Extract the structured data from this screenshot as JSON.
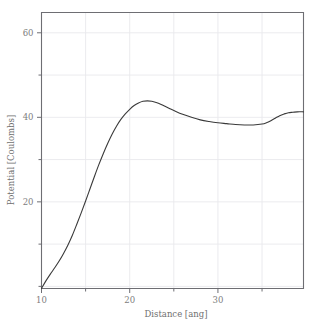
{
  "chart_data": {
    "type": "line",
    "title": "",
    "subtitle": "",
    "xlabel": "Distance [ang]",
    "ylabel": "Potential [Coulombs]",
    "xlim": [
      10,
      39.7
    ],
    "ylim": [
      -0.5,
      64.8
    ],
    "xticks": [
      10,
      15,
      20,
      25,
      30,
      35
    ],
    "xticklabels": [
      "10",
      "",
      "20",
      "",
      "30",
      ""
    ],
    "xtick_major_labeled": [
      "10",
      "20",
      "30"
    ],
    "yticks": [
      0,
      10,
      20,
      30,
      40,
      50,
      60
    ],
    "yticklabels": [
      "",
      "",
      "20",
      "",
      "40",
      "",
      "60"
    ],
    "ytick_major_labeled": [
      "20",
      "40",
      "60"
    ],
    "grid": true,
    "grid_color": "#e9e9ec",
    "legend": null,
    "legend_position": "none",
    "line_color": "#3a3a3a",
    "line_width": 1.1,
    "axis_color": "#6e6e73",
    "background": "#ffffff",
    "series": [
      {
        "name": "potential",
        "x": [
          10.0,
          10.5,
          11.0,
          11.5,
          12.0,
          12.5,
          13.0,
          13.5,
          14.0,
          14.5,
          15.0,
          15.5,
          16.0,
          16.5,
          17.0,
          17.5,
          18.0,
          18.5,
          19.0,
          19.5,
          20.0,
          20.5,
          21.0,
          21.5,
          22.0,
          22.5,
          23.0,
          23.5,
          24.0,
          24.5,
          25.0,
          26.0,
          27.0,
          28.0,
          29.0,
          30.0,
          31.0,
          32.0,
          33.0,
          34.0,
          35.0,
          35.5,
          36.0,
          36.5,
          37.0,
          37.5,
          38.0,
          38.5,
          39.0,
          39.7
        ],
        "y": [
          -0.5,
          1.3,
          2.9,
          4.4,
          6.0,
          7.8,
          9.8,
          12.1,
          14.7,
          17.4,
          20.2,
          23.1,
          26.0,
          28.8,
          31.4,
          33.8,
          36.0,
          37.9,
          39.5,
          40.8,
          41.9,
          42.8,
          43.4,
          43.8,
          43.9,
          43.8,
          43.5,
          43.1,
          42.6,
          42.1,
          41.6,
          40.7,
          40.0,
          39.4,
          39.0,
          38.7,
          38.5,
          38.3,
          38.2,
          38.2,
          38.4,
          38.7,
          39.2,
          39.8,
          40.4,
          40.8,
          41.1,
          41.2,
          41.3,
          41.3
        ]
      }
    ]
  },
  "axes": {
    "x_label": "Distance [ang]",
    "y_label": "Potential [Coulombs]",
    "x_tick_labels": [
      "10",
      "20",
      "30"
    ],
    "y_tick_labels": [
      "20",
      "40",
      "60"
    ]
  }
}
